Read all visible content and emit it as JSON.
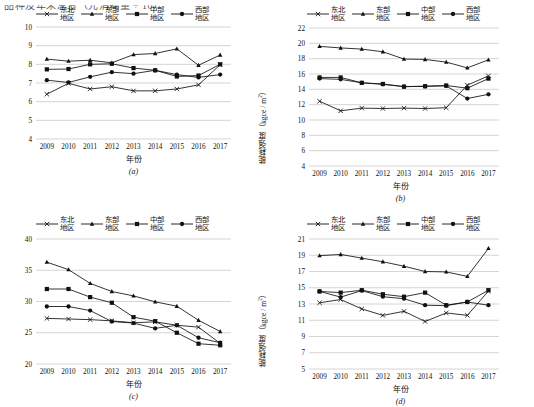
{
  "figure": {
    "cut_off_header": "品种及年末总台（元消耗量 ÷ 10）",
    "axis_label_x": "年份",
    "axis_label_y_prefix": "能耗强度（kgce / m",
    "axis_label_y_suffix": "）",
    "y_exponent": "2",
    "years": [
      "2009",
      "2010",
      "2011",
      "2012",
      "2013",
      "2014",
      "2015",
      "2016",
      "2017"
    ],
    "legend": [
      {
        "name": "northeast",
        "label_line1": "东北",
        "label_line2": "地区",
        "marker": "cross"
      },
      {
        "name": "east",
        "label_line1": "东部",
        "label_line2": "地区",
        "marker": "triangle"
      },
      {
        "name": "central",
        "label_line1": "中部",
        "label_line2": "地区",
        "marker": "square"
      },
      {
        "name": "west",
        "label_line1": "西部",
        "label_line2": "地区",
        "marker": "circle"
      }
    ]
  },
  "chart_data": [
    {
      "id": "a",
      "caption": "(a)",
      "type": "line",
      "title": "",
      "xlabel": "年份",
      "ylabel": "能耗强度 (kgce / m2)",
      "x": [
        "2009",
        "2010",
        "2011",
        "2012",
        "2013",
        "2014",
        "2015",
        "2016",
        "2017"
      ],
      "ylim": [
        4,
        10
      ],
      "yticks": [
        4,
        5,
        6,
        7,
        8,
        9,
        10
      ],
      "grid": true,
      "legend_position": "top",
      "series": [
        {
          "name": "东北地区",
          "marker": "cross",
          "values": [
            6.4,
            6.98,
            6.68,
            6.8,
            6.58,
            6.58,
            6.68,
            6.9,
            7.98
          ]
        },
        {
          "name": "东部地区",
          "marker": "triangle",
          "values": [
            8.28,
            8.17,
            8.22,
            8.08,
            8.52,
            8.58,
            8.83,
            7.95,
            8.5
          ]
        },
        {
          "name": "中部地区",
          "marker": "square",
          "values": [
            7.73,
            7.75,
            8.0,
            8.03,
            7.8,
            7.68,
            7.35,
            7.4,
            8.0
          ]
        },
        {
          "name": "西部地区",
          "marker": "circle",
          "values": [
            7.15,
            7.03,
            7.33,
            7.58,
            7.5,
            7.68,
            7.45,
            7.3,
            7.45
          ]
        }
      ]
    },
    {
      "id": "b",
      "caption": "(b)",
      "type": "line",
      "title": "",
      "xlabel": "年份",
      "ylabel": "能耗强度 (kgce / m2)",
      "x": [
        "2009",
        "2010",
        "2011",
        "2012",
        "2013",
        "2014",
        "2015",
        "2016",
        "2017"
      ],
      "ylim": [
        4,
        22
      ],
      "yticks": [
        4,
        6,
        8,
        10,
        12,
        14,
        16,
        18,
        20,
        22
      ],
      "grid": true,
      "legend_position": "top",
      "series": [
        {
          "name": "东北地区",
          "marker": "cross",
          "values": [
            12.45,
            11.2,
            11.55,
            11.5,
            11.55,
            11.5,
            11.6,
            14.55,
            15.75
          ]
        },
        {
          "name": "东部地区",
          "marker": "triangle",
          "values": [
            19.6,
            19.4,
            19.25,
            18.9,
            17.95,
            17.9,
            17.55,
            16.8,
            17.85
          ]
        },
        {
          "name": "中部地区",
          "marker": "square",
          "values": [
            15.55,
            15.55,
            14.85,
            14.7,
            14.35,
            14.4,
            14.5,
            14.15,
            15.4
          ]
        },
        {
          "name": "西部地区",
          "marker": "circle",
          "values": [
            15.4,
            15.3,
            14.85,
            14.65,
            14.35,
            14.4,
            14.45,
            12.8,
            13.35
          ]
        }
      ]
    },
    {
      "id": "c",
      "caption": "(c)",
      "type": "line",
      "title": "",
      "xlabel": "年份",
      "ylabel": "能耗强度 (kgce / m2)",
      "x": [
        "2009",
        "2010",
        "2011",
        "2012",
        "2013",
        "2014",
        "2015",
        "2016",
        "2017"
      ],
      "ylim": [
        20,
        40
      ],
      "yticks": [
        20,
        25,
        30,
        35,
        40
      ],
      "grid": true,
      "legend_position": "top",
      "series": [
        {
          "name": "东北地区",
          "marker": "cross",
          "values": [
            27.3,
            27.2,
            27.1,
            26.9,
            26.6,
            26.75,
            26.2,
            25.9,
            23.3
          ]
        },
        {
          "name": "东部地区",
          "marker": "triangle",
          "values": [
            36.3,
            35.1,
            32.9,
            31.6,
            30.9,
            29.95,
            29.25,
            27.0,
            25.2
          ]
        },
        {
          "name": "中部地区",
          "marker": "square",
          "values": [
            32.0,
            32.0,
            30.7,
            29.8,
            27.5,
            26.85,
            25.0,
            23.25,
            23.0
          ]
        },
        {
          "name": "西部地区",
          "marker": "circle",
          "values": [
            29.2,
            29.2,
            28.55,
            26.8,
            26.55,
            25.7,
            26.2,
            24.2,
            23.4
          ]
        }
      ]
    },
    {
      "id": "d",
      "caption": "(d)",
      "type": "line",
      "title": "",
      "xlabel": "年份",
      "ylabel": "能耗强度 (kgce / m2)",
      "x": [
        "2009",
        "2010",
        "2011",
        "2012",
        "2013",
        "2014",
        "2015",
        "2016",
        "2017"
      ],
      "ylim": [
        5,
        21
      ],
      "yticks": [
        5,
        7,
        9,
        11,
        13,
        15,
        17,
        19,
        21
      ],
      "grid": true,
      "legend_position": "top",
      "series": [
        {
          "name": "东北地区",
          "marker": "cross",
          "values": [
            13.15,
            13.55,
            12.4,
            11.6,
            12.1,
            10.85,
            11.9,
            11.6,
            14.6
          ]
        },
        {
          "name": "东部地区",
          "marker": "triangle",
          "values": [
            18.95,
            19.1,
            18.65,
            18.2,
            17.65,
            17.0,
            16.95,
            16.4,
            19.85
          ]
        },
        {
          "name": "中部地区",
          "marker": "square",
          "values": [
            14.55,
            14.4,
            14.7,
            14.2,
            13.9,
            14.4,
            12.85,
            13.25,
            14.7
          ]
        },
        {
          "name": "西部地区",
          "marker": "circle",
          "values": [
            14.55,
            13.85,
            14.65,
            13.9,
            13.65,
            12.85,
            12.8,
            13.25,
            12.85
          ]
        }
      ]
    }
  ]
}
